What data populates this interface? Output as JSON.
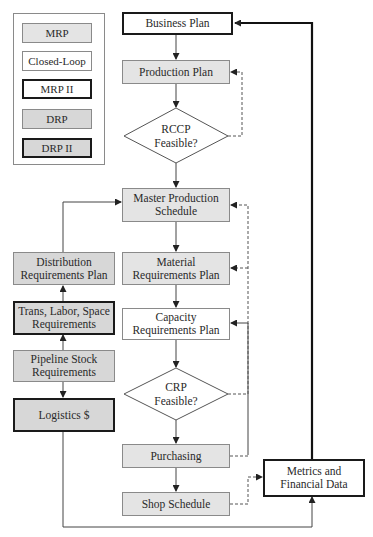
{
  "legend": {
    "items": [
      {
        "label": "MRP",
        "style": "light-gray fill, thin border"
      },
      {
        "label": "Closed-Loop",
        "style": "white fill, thin border"
      },
      {
        "label": "MRP II",
        "style": "white fill, thick border"
      },
      {
        "label": "DRP",
        "style": "gray fill, thin border"
      },
      {
        "label": "DRP II",
        "style": "gray fill, thick border"
      }
    ]
  },
  "nodes": {
    "business_plan": "Business Plan",
    "production_plan": "Production Plan",
    "rccp_line1": "RCCP",
    "rccp_line2": "Feasible?",
    "mps_line1": "Master Production",
    "mps_line2": "Schedule",
    "mat_line1": "Material",
    "mat_line2": "Requirements Plan",
    "cap_line1": "Capacity",
    "cap_line2": "Requirements Plan",
    "crp_line1": "CRP",
    "crp_line2": "Feasible?",
    "purchasing": "Purchasing",
    "shop_schedule": "Shop Schedule",
    "drp_line1": "Distribution",
    "drp_line2": "Requirements Plan",
    "trans_line1": "Trans, Labor, Space",
    "trans_line2": "Requirements",
    "pipeline_line1": "Pipeline Stock",
    "pipeline_line2": "Requirements",
    "logistics": "Logistics $",
    "metrics_line1": "Metrics and",
    "metrics_line2": "Financial Data"
  },
  "colors": {
    "mrp_fill": "#e4e4e4",
    "drp_fill": "#d7d7d7",
    "thick_border": "#1a1a1a",
    "thin_border": "#8a8a8a",
    "line": "#444444"
  }
}
